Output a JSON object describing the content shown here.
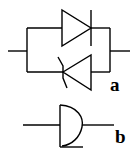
{
  "diagram": {
    "background": "#ffffff",
    "stroke_color": "#000000",
    "symbols": [
      {
        "id": "a",
        "label": "a",
        "description": "antiparallel diode and thyristor pair"
      },
      {
        "id": "b",
        "label": "b",
        "description": "half-round gate symbol with input and output leads"
      }
    ]
  }
}
